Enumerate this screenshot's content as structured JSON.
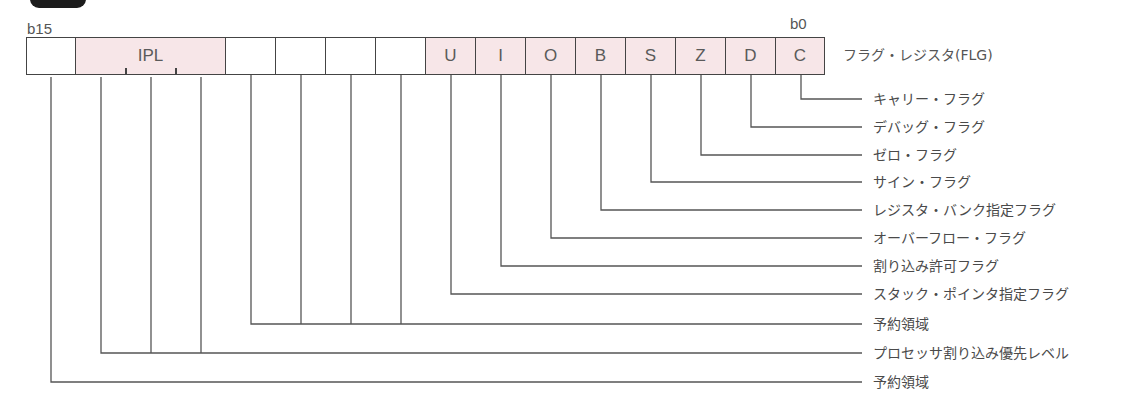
{
  "figure": {
    "register_title": "フラグ・レジスタ(FLG)",
    "msb_label": "b15",
    "lsb_label": "b0",
    "colors": {
      "flag_fill": "#f7e6e8",
      "border": "#444444",
      "line": "#555555",
      "text": "#4a4a4a"
    }
  },
  "bits": [
    {
      "label": "",
      "fill": "white"
    },
    {
      "label": "IPL",
      "fill": "pink",
      "span": 3
    },
    {
      "label": "",
      "fill": "white"
    },
    {
      "label": "",
      "fill": "white"
    },
    {
      "label": "",
      "fill": "white"
    },
    {
      "label": "",
      "fill": "white"
    },
    {
      "label": "U",
      "fill": "pink"
    },
    {
      "label": "I",
      "fill": "pink"
    },
    {
      "label": "O",
      "fill": "pink"
    },
    {
      "label": "B",
      "fill": "pink"
    },
    {
      "label": "S",
      "fill": "pink"
    },
    {
      "label": "Z",
      "fill": "pink"
    },
    {
      "label": "D",
      "fill": "pink"
    },
    {
      "label": "C",
      "fill": "pink"
    }
  ],
  "legend": [
    {
      "bit": "C",
      "label": "キャリー・フラグ"
    },
    {
      "bit": "D",
      "label": "デバッグ・フラグ"
    },
    {
      "bit": "Z",
      "label": "ゼロ・フラグ"
    },
    {
      "bit": "S",
      "label": "サイン・フラグ"
    },
    {
      "bit": "B",
      "label": "レジスタ・バンク指定フラグ"
    },
    {
      "bit": "O",
      "label": "オーバーフロー・フラグ"
    },
    {
      "bit": "I",
      "label": "割り込み許可フラグ"
    },
    {
      "bit": "U",
      "label": "スタック・ポインタ指定フラグ"
    },
    {
      "bit": "b11-b8",
      "label": "予約領域"
    },
    {
      "bit": "IPL",
      "label": "プロセッサ割り込み優先レベル"
    },
    {
      "bit": "b15",
      "label": "予約領域"
    }
  ]
}
